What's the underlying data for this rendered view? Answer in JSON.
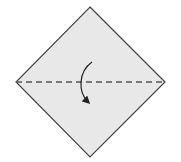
{
  "diagram": {
    "type": "origami-fold-step",
    "paper": {
      "shape": "square-diamond",
      "fill": "#e8e8e8",
      "stroke": "#444444",
      "points": [
        [
          90,
          7
        ],
        [
          165,
          82
        ],
        [
          90,
          157
        ],
        [
          16,
          82
        ]
      ]
    },
    "fold_line": {
      "style": "valley-dashed",
      "color": "#555555",
      "from": [
        16,
        82
      ],
      "to": [
        165,
        82
      ]
    },
    "fold_arrow": {
      "direction": "top-down",
      "color": "#222222",
      "from": [
        92,
        62
      ],
      "to": [
        88,
        103
      ]
    }
  }
}
